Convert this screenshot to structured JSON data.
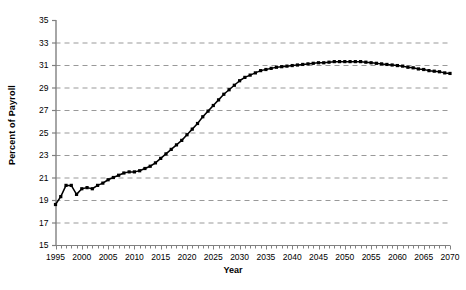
{
  "chart_data": {
    "type": "line",
    "title": "",
    "xlabel": "Year",
    "ylabel": "Percent of Payroll",
    "xlim": [
      1995,
      2070
    ],
    "ylim": [
      15,
      35
    ],
    "ytick_step": 2,
    "xtick_step": 5,
    "minor_xtick_step": 1,
    "grid": "horizontal-dashed",
    "legend": "none",
    "marker": "filled-square",
    "line_color": "#000000",
    "grid_color": "#999999",
    "axis_color": "#808080",
    "yticks": [
      15,
      17,
      19,
      21,
      23,
      25,
      27,
      29,
      31,
      33,
      35
    ],
    "ytick_labels": [
      "15",
      "17",
      "19",
      "21",
      "23",
      "25",
      "27",
      "29",
      "31",
      "33",
      "35"
    ],
    "xticks": [
      1995,
      2000,
      2005,
      2010,
      2015,
      2020,
      2025,
      2030,
      2035,
      2040,
      2045,
      2050,
      2055,
      2060,
      2065,
      2070
    ],
    "xtick_labels": [
      "1995",
      "2000",
      "2005",
      "2010",
      "2015",
      "2020",
      "2025",
      "2030",
      "2035",
      "2040",
      "2045",
      "2050",
      "2055",
      "2060",
      "2065",
      "2070"
    ],
    "x": [
      1995,
      1996,
      1997,
      1998,
      1999,
      2000,
      2001,
      2002,
      2003,
      2004,
      2005,
      2006,
      2007,
      2008,
      2009,
      2010,
      2011,
      2012,
      2013,
      2014,
      2015,
      2016,
      2017,
      2018,
      2019,
      2020,
      2021,
      2022,
      2023,
      2024,
      2025,
      2026,
      2027,
      2028,
      2029,
      2030,
      2031,
      2032,
      2033,
      2034,
      2035,
      2036,
      2037,
      2038,
      2039,
      2040,
      2041,
      2042,
      2043,
      2044,
      2045,
      2046,
      2047,
      2048,
      2049,
      2050,
      2051,
      2052,
      2053,
      2054,
      2055,
      2056,
      2057,
      2058,
      2059,
      2060,
      2061,
      2062,
      2063,
      2064,
      2065,
      2066,
      2067,
      2068,
      2069,
      2070
    ],
    "values": [
      18.6,
      19.3,
      20.3,
      20.3,
      19.5,
      20.0,
      20.1,
      20.0,
      20.3,
      20.5,
      20.8,
      21.0,
      21.2,
      21.4,
      21.5,
      21.5,
      21.6,
      21.8,
      22.0,
      22.3,
      22.7,
      23.1,
      23.5,
      23.9,
      24.3,
      24.8,
      25.3,
      25.8,
      26.4,
      26.9,
      27.4,
      27.9,
      28.4,
      28.8,
      29.2,
      29.6,
      29.9,
      30.1,
      30.3,
      30.5,
      30.6,
      30.7,
      30.8,
      30.85,
      30.9,
      30.95,
      31.0,
      31.05,
      31.1,
      31.15,
      31.2,
      31.2,
      31.25,
      31.3,
      31.3,
      31.3,
      31.3,
      31.3,
      31.3,
      31.25,
      31.2,
      31.15,
      31.1,
      31.05,
      31.0,
      30.95,
      30.9,
      30.8,
      30.75,
      30.65,
      30.6,
      30.5,
      30.45,
      30.4,
      30.3,
      30.25
    ],
    "series": [
      {
        "name": "Cost as Percent of Payroll",
        "values": [
          18.6,
          19.3,
          20.3,
          20.3,
          19.5,
          20.0,
          20.1,
          20.0,
          20.3,
          20.5,
          20.8,
          21.0,
          21.2,
          21.4,
          21.5,
          21.5,
          21.6,
          21.8,
          22.0,
          22.3,
          22.7,
          23.1,
          23.5,
          23.9,
          24.3,
          24.8,
          25.3,
          25.8,
          26.4,
          26.9,
          27.4,
          27.9,
          28.4,
          28.8,
          29.2,
          29.6,
          29.9,
          30.1,
          30.3,
          30.5,
          30.6,
          30.7,
          30.8,
          30.85,
          30.9,
          30.95,
          31.0,
          31.05,
          31.1,
          31.15,
          31.2,
          31.2,
          31.25,
          31.3,
          31.3,
          31.3,
          31.3,
          31.3,
          31.3,
          31.25,
          31.2,
          31.15,
          31.1,
          31.05,
          31.0,
          30.95,
          30.9,
          30.8,
          30.75,
          30.65,
          30.6,
          30.5,
          30.45,
          30.4,
          30.3,
          30.25
        ]
      }
    ]
  }
}
